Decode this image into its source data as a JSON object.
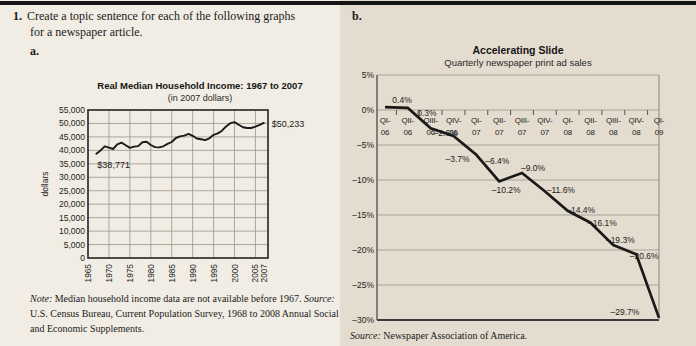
{
  "page": {
    "question_number": "1.",
    "question_line1": "Create a topic sentence for each of the following graphs",
    "question_line2": "for a newspaper article.",
    "label_a": "a.",
    "label_b": "b."
  },
  "colors": {
    "page_bg": "#f1ede4",
    "right_bg_tint": "#e9e2d6",
    "top_rule": "#151515",
    "line": "#1a1a1a",
    "grid": "#9b968b",
    "border": "#333333"
  },
  "chart_a_text": {
    "title": "Real Median Household Income: 1967 to 2007",
    "subtitle": "(in 2007 dollars)",
    "ylabel": "dollars",
    "note_label": "Note:",
    "note_text": "Median household income data are not available before 1967.",
    "source_label": "Source:",
    "source_text": "U.S. Census Bureau, Current Population Survey, 1968 to 2008 Annual Social and Economic Supplements."
  },
  "chart_b_text": {
    "title": "Accelerating Slide",
    "subtitle": "Quarterly newspaper print ad sales",
    "source_label": "Source:",
    "source_text": "Newspaper Association of America."
  },
  "chart_data": [
    {
      "type": "line",
      "title": "Real Median Household Income: 1967 to 2007",
      "subtitle": "(in 2007 dollars)",
      "ylabel": "dollars",
      "ylim": [
        0,
        55000
      ],
      "ytick_step": 5000,
      "ytick_labels": [
        "55,000",
        "50,000",
        "45,000",
        "40,000",
        "35,000",
        "30,000",
        "25,000",
        "20,000",
        "15,000",
        "10,000",
        "5,000",
        "0"
      ],
      "ytick_values": [
        55000,
        50000,
        45000,
        40000,
        35000,
        30000,
        25000,
        20000,
        15000,
        10000,
        5000,
        0
      ],
      "xticks": [
        1965,
        1970,
        1975,
        1980,
        1985,
        1990,
        1995,
        2000,
        2005,
        2007
      ],
      "grid": true,
      "x": [
        1967,
        1968,
        1969,
        1970,
        1971,
        1972,
        1973,
        1974,
        1975,
        1976,
        1977,
        1978,
        1979,
        1980,
        1981,
        1982,
        1983,
        1984,
        1985,
        1986,
        1987,
        1988,
        1989,
        1990,
        1991,
        1992,
        1993,
        1994,
        1995,
        1996,
        1997,
        1998,
        1999,
        2000,
        2001,
        2002,
        2003,
        2004,
        2005,
        2006,
        2007
      ],
      "values": [
        38771,
        40000,
        41500,
        41000,
        40500,
        42200,
        42900,
        41900,
        40900,
        41400,
        41600,
        43000,
        43200,
        42000,
        41200,
        41100,
        41500,
        42400,
        43100,
        44600,
        45200,
        45500,
        46100,
        45400,
        44400,
        44100,
        43800,
        44500,
        45800,
        46300,
        47300,
        48900,
        50100,
        50500,
        49500,
        48600,
        48300,
        48300,
        48800,
        49500,
        50233
      ],
      "annotations": [
        {
          "year": 1967,
          "value": 38771,
          "text": "$38,771",
          "dx": 1,
          "dy": 14,
          "anchor": "start"
        },
        {
          "year": 2007,
          "value": 50233,
          "text": "$50,233",
          "dx": 8,
          "dy": 4,
          "anchor": "start"
        }
      ]
    },
    {
      "type": "line",
      "title": "Accelerating Slide",
      "subtitle": "Quarterly newspaper print ad sales",
      "ylim": [
        -30,
        5
      ],
      "ytick_labels": [
        "5%",
        "0%",
        "–5%",
        "–10%",
        "–15%",
        "–20%",
        "–25%",
        "–30%"
      ],
      "ytick_values": [
        5,
        0,
        -5,
        -10,
        -15,
        -20,
        -25,
        -30
      ],
      "categories": [
        "QI-06",
        "QII-06",
        "QIII-06",
        "QIV-06",
        "QI-07",
        "QII-07",
        "QIII-07",
        "QIV-07",
        "QI-08",
        "QII-08",
        "QIII-08",
        "QIV-08",
        "QI-09"
      ],
      "values": [
        0.4,
        0.3,
        -2.6,
        -3.7,
        -6.4,
        -10.2,
        -9.0,
        -11.6,
        -14.4,
        -16.1,
        -19.3,
        -20.6,
        -29.7
      ],
      "point_labels": [
        "0.4%",
        "0.3%",
        "–2.6%",
        "–3.7%",
        "–6.4%",
        "–10.2%",
        "–9.0%",
        "–11.6%",
        "–14.4%",
        "–16.1%",
        "–19.3%",
        "–20.6%",
        "–29.7%"
      ],
      "grid": true,
      "legend": "none"
    }
  ]
}
